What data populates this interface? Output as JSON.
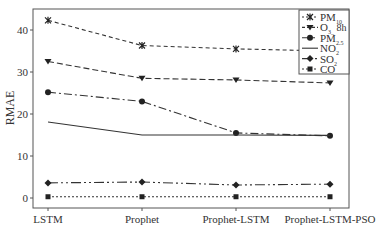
{
  "chart_data": {
    "type": "line",
    "title": "",
    "xlabel": "",
    "ylabel": "RMAE",
    "ylim": [
      -2,
      45
    ],
    "yticks": [
      0,
      10,
      20,
      30,
      40
    ],
    "categories": [
      "LSTM",
      "Prophet",
      "Prophet-LSTM",
      "Prophet-LSTM-PSO"
    ],
    "grid": false,
    "legend_position": "upper right",
    "series": [
      {
        "name": "PM10",
        "label_main": "PM",
        "label_sub": "10",
        "marker": "x-star",
        "dash": "4,3",
        "values": [
          42.3,
          36.3,
          35.5,
          35.0
        ]
      },
      {
        "name": "O3_8h",
        "label_main": "O",
        "label_sub": "3_8h",
        "label_suffix": "8h",
        "marker": "triangle-down",
        "dash": "6,3",
        "values": [
          32.5,
          28.5,
          28.1,
          27.4
        ]
      },
      {
        "name": "PM2.5",
        "label_main": "PM",
        "label_sub": "2.5",
        "marker": "circle",
        "dash": "8,3,2,3",
        "values": [
          25.2,
          23.0,
          15.5,
          14.8
        ]
      },
      {
        "name": "NO2",
        "label_main": "NO",
        "label_sub": "2",
        "marker": "none",
        "dash": "",
        "values": [
          18.1,
          15.0,
          15.0,
          14.9
        ]
      },
      {
        "name": "SO2",
        "label_main": "SO",
        "label_sub": "2",
        "marker": "diamond",
        "dash": "10,3,2,3,2,3",
        "values": [
          3.6,
          3.8,
          3.1,
          3.3
        ]
      },
      {
        "name": "CO",
        "label_main": "CO",
        "label_sub": "",
        "marker": "square",
        "dash": "2,2",
        "values": [
          0.3,
          0.3,
          0.3,
          0.3
        ]
      }
    ]
  }
}
